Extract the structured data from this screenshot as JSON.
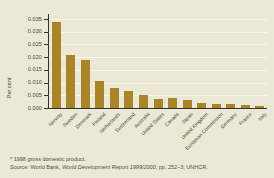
{
  "colors": {
    "paper": "#ece8d6",
    "bar": "#aa8527",
    "gridline": "#f8f5e9",
    "axis": "#35332c",
    "text": "#45433b"
  },
  "chart_data": {
    "type": "bar",
    "title": "",
    "xlabel": "",
    "ylabel": "Per cent",
    "ylim": [
      0,
      0.035
    ],
    "grid": true,
    "legend": false,
    "yticks": [
      "0.000",
      "0.005",
      "0.010",
      "0.015",
      "0.020",
      "0.025",
      "0.030",
      "0.035"
    ],
    "categories": [
      "Norway",
      "Sweden",
      "Denmark",
      "Finland",
      "Netherlands",
      "Switzerland",
      "Australia",
      "United States",
      "Canada",
      "Japan",
      "United Kingdom",
      "European Commission",
      "Germany",
      "France",
      "Italy"
    ],
    "values": [
      0.034,
      0.021,
      0.019,
      0.0105,
      0.008,
      0.0065,
      0.005,
      0.0035,
      0.004,
      0.003,
      0.002,
      0.0016,
      0.0014,
      0.0011,
      0.0008
    ]
  },
  "footnotes": {
    "note": "* 1998 gross domestic product.",
    "source_prefix": "Source: World Bank, ",
    "source_title": "World Development Report 1999/2000",
    "source_suffix": ", pp. 252–3; UNHCR."
  }
}
